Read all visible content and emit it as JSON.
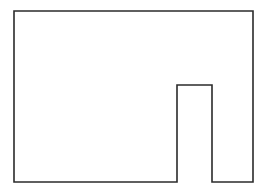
{
  "figure": {
    "title": "",
    "type": "geometric-shape-outline",
    "shape_name": "rectangle-with-bottom-notch",
    "background_color": "#ffffff",
    "stroke_color": "#2b2b2b",
    "fill_color": "#ffffff",
    "stroke_width": 1.6,
    "canvas": {
      "width": 267,
      "height": 192
    },
    "bounding_box": {
      "left": 14,
      "top": 11,
      "right": 253,
      "bottom": 182,
      "width": 239,
      "height": 171
    },
    "notch": {
      "description": "rectangular cutout opening downward on the bottom edge",
      "left": 177,
      "right": 212,
      "top": 85,
      "bottom": 182,
      "width": 35,
      "height": 97
    },
    "vertices": [
      {
        "label": "top-left",
        "x": 14,
        "y": 11
      },
      {
        "label": "top-right",
        "x": 253,
        "y": 11
      },
      {
        "label": "bottom-right",
        "x": 253,
        "y": 182
      },
      {
        "label": "notch-bottom-right",
        "x": 212,
        "y": 182
      },
      {
        "label": "notch-top-right",
        "x": 212,
        "y": 85
      },
      {
        "label": "notch-top-left",
        "x": 177,
        "y": 85
      },
      {
        "label": "notch-bottom-left",
        "x": 177,
        "y": 182
      },
      {
        "label": "bottom-left",
        "x": 14,
        "y": 182
      }
    ],
    "path_d": "M 14 11 L 253 11 L 253 182 L 212 182 L 212 85 L 177 85 L 177 182 L 14 182 Z",
    "labels": [],
    "annotations": []
  }
}
